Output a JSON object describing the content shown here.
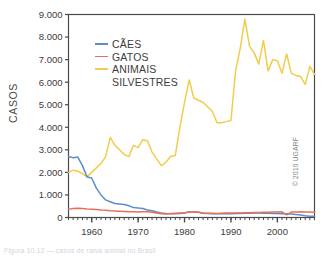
{
  "figure": {
    "background": "#ffffff",
    "copyright": "© 2010 UGARF",
    "caption": "Figura 10.12 — casos de raiva animal no Brasil",
    "frame_color": "#4a4a4a"
  },
  "chart_data": {
    "type": "line",
    "title": "",
    "xlabel": "",
    "ylabel": "CASOS",
    "xlim": [
      1955,
      2008
    ],
    "ylim": [
      0,
      9000
    ],
    "grid": false,
    "legend_position": "upper-left-inside",
    "xticks": [
      1960,
      1970,
      1980,
      1990,
      2000
    ],
    "xtick_labels": [
      "1960",
      "1970",
      "1980",
      "1990",
      "2000"
    ],
    "xminor_step": 1,
    "yticks": [
      0,
      1000,
      2000,
      3000,
      4000,
      5000,
      6000,
      7000,
      8000,
      9000
    ],
    "ytick_labels": [
      "0",
      "1.000",
      "2.000",
      "3.000",
      "4.000",
      "5.000",
      "6.000",
      "7.000",
      "8.000",
      "9.000"
    ],
    "x": [
      1955,
      1956,
      1957,
      1958,
      1959,
      1960,
      1961,
      1962,
      1963,
      1964,
      1965,
      1966,
      1967,
      1968,
      1969,
      1970,
      1971,
      1972,
      1973,
      1974,
      1975,
      1976,
      1977,
      1978,
      1979,
      1980,
      1981,
      1982,
      1983,
      1984,
      1985,
      1986,
      1987,
      1988,
      1989,
      1990,
      1991,
      1992,
      1993,
      1994,
      1995,
      1996,
      1997,
      1998,
      1999,
      2000,
      2001,
      2002,
      2003,
      2004,
      2005,
      2006,
      2007,
      2008
    ],
    "series": [
      {
        "name": "CÃES",
        "color": "#5b8fc9",
        "values": [
          2700,
          2650,
          2680,
          2300,
          1800,
          1750,
          1300,
          1000,
          780,
          700,
          620,
          600,
          580,
          520,
          440,
          420,
          400,
          330,
          300,
          240,
          200,
          180,
          170,
          165,
          175,
          200,
          250,
          260,
          230,
          190,
          180,
          170,
          165,
          170,
          180,
          170,
          175,
          180,
          185,
          190,
          195,
          200,
          190,
          185,
          180,
          175,
          170,
          165,
          150,
          130,
          110,
          80,
          60,
          50
        ]
      },
      {
        "name": "GATOS",
        "color": "#e8705a",
        "values": [
          360,
          400,
          410,
          400,
          380,
          370,
          350,
          330,
          320,
          300,
          290,
          280,
          270,
          260,
          250,
          240,
          260,
          250,
          230,
          200,
          170,
          160,
          180,
          190,
          200,
          210,
          240,
          250,
          230,
          200,
          190,
          185,
          180,
          190,
          200,
          195,
          200,
          205,
          210,
          215,
          220,
          225,
          230,
          235,
          240,
          245,
          250,
          120,
          240,
          245,
          250,
          245,
          240,
          235
        ]
      },
      {
        "name": "ANIMAIS SILVESTRES",
        "color": "#f2cc4a",
        "values": [
          2000,
          2100,
          2050,
          1950,
          1800,
          2000,
          2200,
          2400,
          2700,
          3550,
          3200,
          3000,
          2800,
          2700,
          3200,
          3100,
          3450,
          3400,
          2900,
          2600,
          2300,
          2450,
          2700,
          2750,
          4000,
          5100,
          6100,
          5300,
          5200,
          5100,
          4900,
          4700,
          4200,
          4200,
          4250,
          4300,
          6500,
          7500,
          8800,
          7600,
          7300,
          6800,
          7850,
          6500,
          7000,
          6950,
          6400,
          7250,
          6400,
          6300,
          6250,
          5900,
          6700,
          6350
        ]
      }
    ]
  },
  "legend": {
    "entries": [
      {
        "label": "CÃES",
        "color": "#5b8fc9"
      },
      {
        "label": "GATOS",
        "color": "#e8705a"
      },
      {
        "label": "ANIMAIS",
        "label2": "SILVESTRES",
        "color": "#f2cc4a"
      }
    ]
  }
}
